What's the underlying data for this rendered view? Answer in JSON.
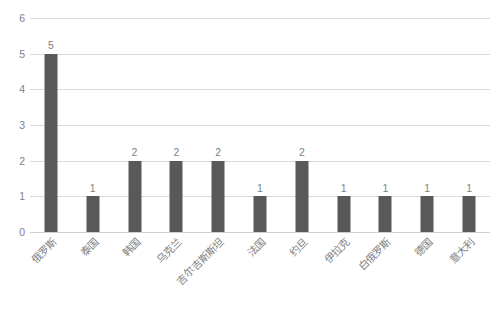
{
  "chart_data": {
    "type": "bar",
    "title": "",
    "subtitle": "",
    "xlabel": "",
    "ylabel": "",
    "categories": [
      "俄罗斯",
      "泰国",
      "韩国",
      "乌克兰",
      "吉尔吉斯斯坦",
      "法国",
      "约旦",
      "伊拉克",
      "白俄罗斯",
      "德国",
      "意大利"
    ],
    "values": [
      5,
      1,
      2,
      2,
      2,
      1,
      2,
      1,
      1,
      1,
      1
    ],
    "data_labels": [
      "5",
      "1",
      "2",
      "2",
      "2",
      "1",
      "2",
      "1",
      "1",
      "1",
      "1"
    ],
    "ylim": [
      0,
      6
    ],
    "ytick_labels": [
      "0",
      "1",
      "2",
      "3",
      "4",
      "5",
      "6"
    ],
    "ytick_values": [
      0,
      1,
      2,
      3,
      4,
      5,
      6
    ],
    "grid": true,
    "grid_axis": "y",
    "legend": false,
    "legend_position": "none",
    "bar_color": "#595959",
    "grid_color": "#d9d9d9",
    "text_color": "#7f7f7f",
    "background_color": "#ffffff",
    "xtick_rotation": -45
  }
}
